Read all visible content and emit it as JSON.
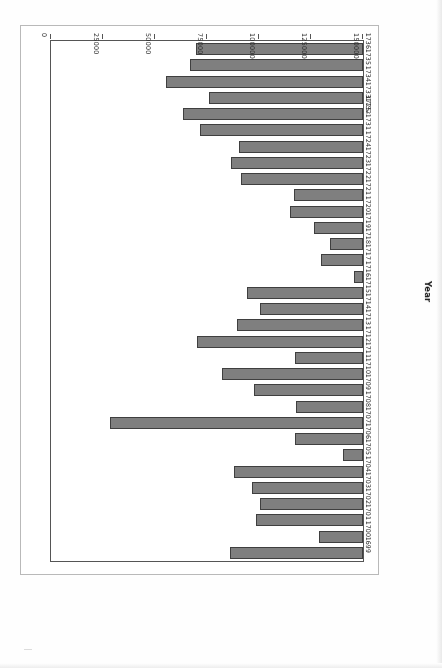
{
  "chart_data": {
    "type": "bar",
    "orientation": "horizontal",
    "title": "",
    "xlabel": "Year",
    "ylabel": "Number of Deerskins Exported",
    "categories": [
      "1699",
      "1700",
      "1701",
      "1702",
      "1703",
      "1704",
      "1705",
      "1706",
      "1707",
      "1708",
      "1709",
      "1710",
      "1711",
      "1712",
      "1713",
      "1714",
      "1715",
      "1716",
      "1717",
      "1718",
      "1719",
      "1720",
      "1721",
      "1722",
      "1723",
      "1724",
      "1725-1731",
      "1732",
      "1733",
      "1734",
      "1735",
      "1736"
    ],
    "values": [
      64000,
      21200,
      51400,
      49400,
      53300,
      62000,
      9800,
      32500,
      121600,
      32000,
      52300,
      68000,
      32900,
      79800,
      60500,
      49400,
      55900,
      4200,
      20300,
      15800,
      23600,
      34900,
      33300,
      58800,
      63300,
      59600,
      78500,
      86700,
      74000,
      94700,
      83300,
      80100
    ],
    "value_axis_ticks": [
      0,
      25000,
      50000,
      75000,
      100000,
      125000,
      150000
    ],
    "value_axis_tick_labels": [
      "0",
      "25000",
      "50000",
      "75000",
      "100000",
      "125000",
      "150000"
    ],
    "ylim": [
      0,
      150000
    ],
    "grid": false,
    "legend": null,
    "bar_color": "#7f7f7f",
    "bar_edge_color": "#3f3f3f",
    "page_rotation_degrees": 180
  },
  "figure": {
    "axis_titles": {
      "category_axis": "Year",
      "value_axis": "Number of Deerskins Exported"
    }
  }
}
